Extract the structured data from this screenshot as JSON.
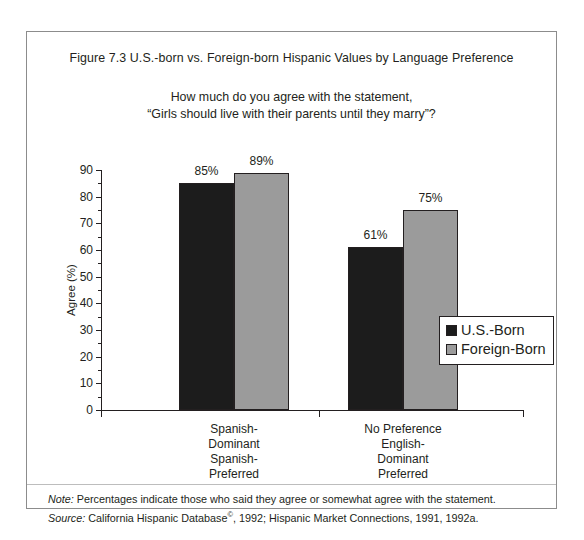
{
  "figure": {
    "title": "Figure 7.3  U.S.-born vs. Foreign-born Hispanic Values by Language Preference",
    "subtitle_line1": "How much do you agree with the statement,",
    "subtitle_line2": "“Girls should live with their parents until they marry”?"
  },
  "footnote": {
    "note_lead": "Note:",
    "note_text": " Percentages indicate those who said they agree or somewhat agree with the statement.",
    "source_lead": "Source:",
    "source_text_a": " California Hispanic Database",
    "source_mark": "©",
    "source_text_b": ", 1992; Hispanic Market Connections, 1991, 1992a."
  },
  "colors": {
    "us_born": "#1c1c1c",
    "foreign_born": "#9b9b9b",
    "axis": "#231f20",
    "frame": "#8c8c8c"
  },
  "chart_data": {
    "type": "bar",
    "title": "Figure 7.3  U.S.-born vs. Foreign-born Hispanic Values by Language Preference",
    "subtitle": "How much do you agree with the statement, “Girls should live with their parents until they marry”?",
    "xlabel": "",
    "ylabel": "Agree (%)",
    "ylim": [
      0,
      90
    ],
    "ytick_step": 10,
    "yticks": [
      0,
      10,
      20,
      30,
      40,
      50,
      60,
      70,
      80,
      90
    ],
    "ytick_labels": [
      "0",
      "10",
      "20",
      "30",
      "40",
      "50",
      "60",
      "70",
      "80",
      "90"
    ],
    "minor_ticks": true,
    "grid": false,
    "legend_position": "right",
    "categories": [
      "Spanish-\nDominant\nSpanish-\nPreferred",
      "No Preference\nEnglish-\nDominant\nPreferred"
    ],
    "category_lines": [
      [
        "Spanish-",
        "Dominant",
        "Spanish-",
        "Preferred"
      ],
      [
        "No  Preference",
        "English-",
        "Dominant",
        "Preferred"
      ]
    ],
    "series": [
      {
        "name": "U.S.-Born",
        "color": "#1c1c1c",
        "values": [
          85,
          61
        ],
        "labels": [
          "85%",
          "61%"
        ]
      },
      {
        "name": "Foreign-Born",
        "color": "#9b9b9b",
        "values": [
          89,
          75
        ],
        "labels": [
          "89%",
          "75%"
        ]
      }
    ]
  }
}
